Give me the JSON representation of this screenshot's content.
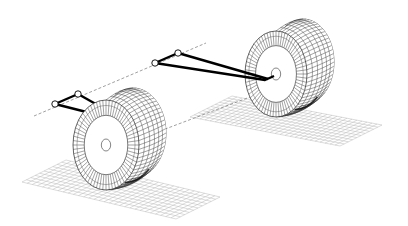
{
  "diagram": {
    "colors": {
      "background": "#ffffff",
      "linework": "#111111",
      "grid": "#b8b8b8",
      "dashed_axis": "#777777",
      "wishbone": "#000000"
    },
    "components": [
      {
        "id": "left-wheel",
        "type": "wheel"
      },
      {
        "id": "right-wheel",
        "type": "wheel"
      },
      {
        "id": "left-wishbone",
        "type": "wishbone-arm"
      },
      {
        "id": "right-wishbone",
        "type": "wishbone-arm"
      },
      {
        "id": "left-ground-grid",
        "type": "ground-plane"
      },
      {
        "id": "right-ground-grid",
        "type": "ground-plane"
      },
      {
        "id": "upper-pivot-axis",
        "type": "dashed-line"
      },
      {
        "id": "lower-axis",
        "type": "dashed-line"
      }
    ]
  }
}
